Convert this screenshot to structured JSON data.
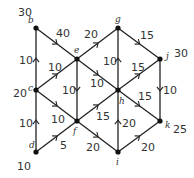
{
  "diagram": {
    "type": "directed-network",
    "nodes": [
      {
        "id": "b",
        "label": "b",
        "value": "30",
        "x": 36,
        "y": 28
      },
      {
        "id": "c",
        "label": "c",
        "value": "20",
        "x": 36,
        "y": 90
      },
      {
        "id": "d",
        "label": "d",
        "value": "10",
        "x": 36,
        "y": 152
      },
      {
        "id": "e",
        "label": "e",
        "value": "",
        "x": 77,
        "y": 59
      },
      {
        "id": "f",
        "label": "f",
        "value": "",
        "x": 77,
        "y": 121
      },
      {
        "id": "g",
        "label": "g",
        "value": "",
        "x": 118,
        "y": 28
      },
      {
        "id": "h",
        "label": "h",
        "value": "",
        "x": 118,
        "y": 90
      },
      {
        "id": "i",
        "label": "i",
        "value": "",
        "x": 118,
        "y": 152
      },
      {
        "id": "j",
        "label": "j",
        "value": "30",
        "x": 160,
        "y": 59
      },
      {
        "id": "k",
        "label": "k",
        "value": "25",
        "x": 160,
        "y": 121
      }
    ],
    "edges": [
      {
        "from": "c",
        "to": "b",
        "weight": "10"
      },
      {
        "from": "b",
        "to": "e",
        "weight": "40"
      },
      {
        "from": "c",
        "to": "e",
        "weight": "10"
      },
      {
        "from": "e",
        "to": "g",
        "weight": "20"
      },
      {
        "from": "e",
        "to": "h",
        "weight": "10"
      },
      {
        "from": "e",
        "to": "f",
        "weight": "10"
      },
      {
        "from": "g",
        "to": "j",
        "weight": "15"
      },
      {
        "from": "h",
        "to": "g",
        "weight": "10"
      },
      {
        "from": "f",
        "to": "h",
        "weight": "15"
      },
      {
        "from": "h",
        "to": "j",
        "weight": "15"
      },
      {
        "from": "h",
        "to": "k",
        "weight": "15"
      },
      {
        "from": "j",
        "to": "k",
        "weight": "10"
      },
      {
        "from": "c",
        "to": "f",
        "weight": "10"
      },
      {
        "from": "d",
        "to": "c",
        "weight": "10"
      },
      {
        "from": "d",
        "to": "f",
        "weight": "5"
      },
      {
        "from": "f",
        "to": "i",
        "weight": "20"
      },
      {
        "from": "i",
        "to": "h",
        "weight": "20"
      },
      {
        "from": "i",
        "to": "k",
        "weight": "20"
      }
    ]
  },
  "labels": {
    "b_val": "30",
    "b": "b",
    "c_val": "20",
    "c": "c",
    "d_val": "10",
    "d": "d",
    "e": "e",
    "f": "f",
    "g": "g",
    "h": "h",
    "i": "i",
    "j": "j",
    "j_val": "30",
    "k": "k",
    "k_val": "25",
    "w_cb": "10",
    "w_be": "40",
    "w_ce": "10",
    "w_eg": "20",
    "w_eh": "10",
    "w_ef": "10",
    "w_gj": "15",
    "w_hg": "10",
    "w_fh": "15",
    "w_hj": "15",
    "w_hk": "15",
    "w_jk": "10",
    "w_cf": "10",
    "w_dc": "10",
    "w_df": "5",
    "w_fi": "20",
    "w_ih": "20",
    "w_ik": "20"
  }
}
